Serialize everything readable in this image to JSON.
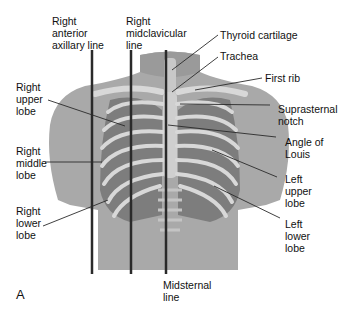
{
  "figure": {
    "panel_letter": "A",
    "colors": {
      "skin": "#a9a9a9",
      "skin_dark": "#8e8e8e",
      "lung": "#7d7d7d",
      "bone": "#d8d8d8",
      "line": "#2a2a2a",
      "text": "#111111"
    }
  },
  "labels": {
    "right_anterior_axillary": "Right\nanterior\naxillary line",
    "right_midclavicular": "Right\nmidclavicular\nline",
    "thyroid_cartilage": "Thyroid cartilage",
    "trachea": "Trachea",
    "first_rib": "First rib",
    "right_upper_lobe": "Right\nupper\nlobe",
    "suprasternal_notch": "Suprasternal\nnotch",
    "angle_of_louis": "Angle of\nLouis",
    "right_middle_lobe": "Right\nmiddle\nlobe",
    "left_upper_lobe": "Left\nupper\nlobe",
    "right_lower_lobe": "Right\nlower\nlobe",
    "left_lower_lobe": "Left\nlower\nlobe",
    "midsternal": "Midsternal\nline"
  }
}
